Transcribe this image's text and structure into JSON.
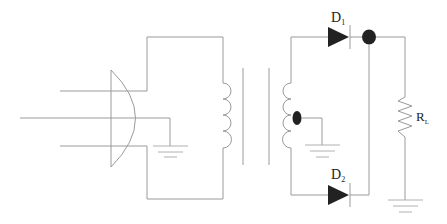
{
  "diagram": {
    "type": "circuit-schematic",
    "colors": {
      "background": "#ffffff",
      "wire": "#9a9a9a",
      "component_fill": "#222222"
    },
    "components": [
      {
        "id": "receiver",
        "kind": "lens-receiver",
        "label": ""
      },
      {
        "id": "primary",
        "kind": "inductor-primary",
        "label": ""
      },
      {
        "id": "core",
        "kind": "transformer-core",
        "label": ""
      },
      {
        "id": "secondary",
        "kind": "inductor-secondary-center-tap",
        "label": ""
      },
      {
        "id": "d1",
        "kind": "diode",
        "label": "D",
        "subscript": "1"
      },
      {
        "id": "d2",
        "kind": "diode",
        "label": "D",
        "subscript": "2"
      },
      {
        "id": "rl",
        "kind": "resistor",
        "label": "R",
        "subscript": "L"
      },
      {
        "id": "gnd1",
        "kind": "ground",
        "label": ""
      },
      {
        "id": "gnd2",
        "kind": "ground",
        "label": ""
      },
      {
        "id": "gnd3",
        "kind": "ground",
        "label": ""
      }
    ],
    "labels": {
      "d1": {
        "main": "D",
        "sub": "1"
      },
      "d2": {
        "main": "D",
        "sub": "2"
      },
      "rl": {
        "main": "R",
        "sub": "L"
      }
    }
  }
}
